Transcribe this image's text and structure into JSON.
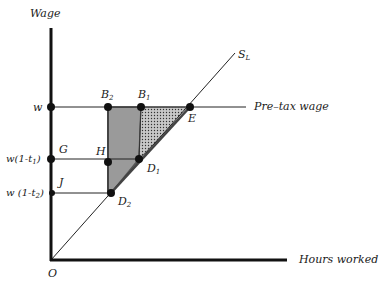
{
  "diagram": {
    "y_axis_label": "Wage",
    "x_axis_label": "Hours worked",
    "origin_label": "O",
    "supply_curve_label": "S",
    "supply_curve_sub": "L",
    "pretax_line_label": "Pre–tax wage",
    "wage_levels": {
      "w": "w",
      "w_t1": "w(1-t",
      "w_t1_sub": "1",
      "w_t1_close": ")",
      "w_t2": "w (1-t",
      "w_t2_sub": "2",
      "w_t2_close": ")"
    },
    "points": {
      "B2": {
        "letter": "B",
        "sub": "2"
      },
      "B1": {
        "letter": "B",
        "sub": "1"
      },
      "E": {
        "letter": "E"
      },
      "G": {
        "letter": "G"
      },
      "H": {
        "letter": "H"
      },
      "D1": {
        "letter": "D",
        "sub": "1"
      },
      "J": {
        "letter": "J"
      },
      "D2": {
        "letter": "D",
        "sub": "2"
      }
    },
    "colors": {
      "axis": "#111111",
      "line": "#222222",
      "shaded_region": "#9a9a9a",
      "dotted_region_bg": "#c8c8c8",
      "dots": "#111111"
    }
  }
}
